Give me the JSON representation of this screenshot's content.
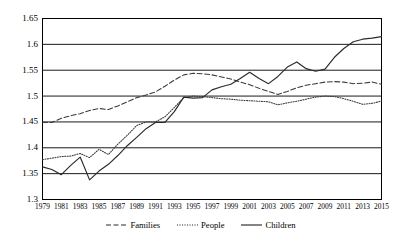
{
  "chart_data": {
    "type": "line",
    "title": "",
    "xlabel": "",
    "ylabel": "",
    "xlim": [
      1979,
      2015
    ],
    "ylim": [
      1.3,
      1.65
    ],
    "grid": "horizontal",
    "legend_position": "bottom",
    "y_ticks": [
      "1.3",
      "1.35",
      "1.4",
      "1.45",
      "1.5",
      "1.55",
      "1.6",
      "1.65"
    ],
    "y_tick_values": [
      1.3,
      1.35,
      1.4,
      1.45,
      1.5,
      1.55,
      1.6,
      1.65
    ],
    "x_tick_labels": [
      "1979",
      "1981",
      "1983",
      "1985",
      "1987",
      "1989",
      "1991",
      "1993",
      "1995",
      "1997",
      "1999",
      "2001",
      "2003",
      "2005",
      "2007",
      "2009",
      "2011",
      "2013",
      "2015"
    ],
    "x": [
      1979,
      1980,
      1981,
      1982,
      1983,
      1984,
      1985,
      1986,
      1987,
      1988,
      1989,
      1990,
      1991,
      1992,
      1993,
      1994,
      1995,
      1996,
      1997,
      1998,
      1999,
      2000,
      2001,
      2002,
      2003,
      2004,
      2005,
      2006,
      2007,
      2008,
      2009,
      2010,
      2011,
      2012,
      2013,
      2014,
      2015
    ],
    "series": [
      {
        "name": "Families",
        "style": "dashed",
        "color": "#3a3a3a",
        "values": [
          1.449,
          1.449,
          1.457,
          1.462,
          1.466,
          1.472,
          1.476,
          1.474,
          1.481,
          1.489,
          1.497,
          1.502,
          1.508,
          1.519,
          1.531,
          1.541,
          1.544,
          1.543,
          1.541,
          1.537,
          1.533,
          1.527,
          1.522,
          1.515,
          1.509,
          1.503,
          1.509,
          1.516,
          1.521,
          1.524,
          1.527,
          1.528,
          1.527,
          1.524,
          1.525,
          1.527,
          1.523
        ]
      },
      {
        "name": "People",
        "style": "dotted",
        "color": "#3a3a3a",
        "values": [
          1.377,
          1.38,
          1.383,
          1.384,
          1.389,
          1.381,
          1.397,
          1.387,
          1.407,
          1.424,
          1.443,
          1.45,
          1.45,
          1.46,
          1.478,
          1.497,
          1.5,
          1.499,
          1.497,
          1.495,
          1.494,
          1.492,
          1.491,
          1.49,
          1.489,
          1.483,
          1.487,
          1.49,
          1.494,
          1.498,
          1.5,
          1.499,
          1.495,
          1.49,
          1.484,
          1.486,
          1.49
        ]
      },
      {
        "name": "Children",
        "style": "solid",
        "color": "#2a2a2a",
        "values": [
          1.363,
          1.358,
          1.348,
          1.366,
          1.382,
          1.338,
          1.355,
          1.368,
          1.385,
          1.404,
          1.42,
          1.437,
          1.449,
          1.449,
          1.47,
          1.498,
          1.496,
          1.497,
          1.512,
          1.518,
          1.523,
          1.534,
          1.546,
          1.534,
          1.524,
          1.538,
          1.556,
          1.566,
          1.553,
          1.548,
          1.552,
          1.575,
          1.592,
          1.605,
          1.61,
          1.612,
          1.615
        ]
      }
    ]
  },
  "series_detail": {
    "families": {
      "label": "Families",
      "points": [
        [
          1979,
          1.449
        ],
        [
          1980,
          1.449
        ],
        [
          1981,
          1.457
        ],
        [
          1982,
          1.462
        ],
        [
          1983,
          1.466
        ],
        [
          1984,
          1.472
        ],
        [
          1985,
          1.476
        ],
        [
          1986,
          1.474
        ],
        [
          1987,
          1.481
        ],
        [
          1988,
          1.489
        ],
        [
          1989,
          1.497
        ],
        [
          1990,
          1.502
        ],
        [
          1991,
          1.508
        ],
        [
          1992,
          1.519
        ],
        [
          1993,
          1.531
        ],
        [
          1994,
          1.541
        ],
        [
          1995,
          1.544
        ],
        [
          1996,
          1.543
        ],
        [
          1997,
          1.541
        ],
        [
          1998,
          1.537
        ],
        [
          1999,
          1.533
        ],
        [
          2000,
          1.527
        ],
        [
          2001,
          1.522
        ],
        [
          2002,
          1.515
        ],
        [
          2003,
          1.509
        ],
        [
          2004,
          1.503
        ],
        [
          2005,
          1.509
        ],
        [
          2006,
          1.516
        ],
        [
          2007,
          1.521
        ],
        [
          2008,
          1.524
        ],
        [
          2009,
          1.527
        ],
        [
          2010,
          1.528
        ],
        [
          2011,
          1.527
        ],
        [
          2012,
          1.524
        ],
        [
          2013,
          1.525
        ],
        [
          2014,
          1.527
        ],
        [
          2015,
          1.523
        ]
      ]
    },
    "people": {
      "label": "People",
      "points": [
        [
          1979,
          1.377
        ],
        [
          1980,
          1.38
        ],
        [
          1981,
          1.383
        ],
        [
          1982,
          1.384
        ],
        [
          1983,
          1.389
        ],
        [
          1984,
          1.381
        ],
        [
          1985,
          1.397
        ],
        [
          1986,
          1.387
        ],
        [
          1987,
          1.407
        ],
        [
          1988,
          1.424
        ],
        [
          1989,
          1.443
        ],
        [
          1990,
          1.45
        ],
        [
          1991,
          1.45
        ],
        [
          1992,
          1.46
        ],
        [
          1993,
          1.478
        ],
        [
          1994,
          1.497
        ],
        [
          1995,
          1.5
        ],
        [
          1996,
          1.499
        ],
        [
          1997,
          1.497
        ],
        [
          1998,
          1.495
        ],
        [
          1999,
          1.494
        ],
        [
          2000,
          1.492
        ],
        [
          2001,
          1.491
        ],
        [
          2002,
          1.49
        ],
        [
          2003,
          1.489
        ],
        [
          2004,
          1.483
        ],
        [
          2005,
          1.487
        ],
        [
          2006,
          1.49
        ],
        [
          2007,
          1.494
        ],
        [
          2008,
          1.498
        ],
        [
          2009,
          1.5
        ],
        [
          2010,
          1.499
        ],
        [
          2011,
          1.495
        ],
        [
          2012,
          1.49
        ],
        [
          2013,
          1.484
        ],
        [
          2014,
          1.486
        ],
        [
          2015,
          1.49
        ]
      ]
    },
    "children": {
      "label": "Children",
      "points": [
        [
          1979,
          1.363
        ],
        [
          1980,
          1.358
        ],
        [
          1981,
          1.348
        ],
        [
          1982,
          1.366
        ],
        [
          1983,
          1.382
        ],
        [
          1984,
          1.338
        ],
        [
          1985,
          1.355
        ],
        [
          1986,
          1.368
        ],
        [
          1987,
          1.385
        ],
        [
          1988,
          1.404
        ],
        [
          1989,
          1.42
        ],
        [
          1990,
          1.437
        ],
        [
          1991,
          1.449
        ],
        [
          1992,
          1.449
        ],
        [
          1993,
          1.47
        ],
        [
          1994,
          1.498
        ],
        [
          1995,
          1.496
        ],
        [
          1996,
          1.497
        ],
        [
          1997,
          1.512
        ],
        [
          1998,
          1.518
        ],
        [
          1999,
          1.523
        ],
        [
          2000,
          1.534
        ],
        [
          2001,
          1.546
        ],
        [
          2002,
          1.534
        ],
        [
          2003,
          1.524
        ],
        [
          2004,
          1.538
        ],
        [
          2005,
          1.556
        ],
        [
          2006,
          1.566
        ],
        [
          2007,
          1.553
        ],
        [
          2008,
          1.548
        ],
        [
          2009,
          1.552
        ],
        [
          2010,
          1.575
        ],
        [
          2011,
          1.592
        ],
        [
          2012,
          1.605
        ],
        [
          2013,
          1.61
        ],
        [
          2014,
          1.612
        ],
        [
          2015,
          1.615
        ]
      ]
    }
  },
  "legend": {
    "items": [
      {
        "label": "Families",
        "style": "dashed"
      },
      {
        "label": "People",
        "style": "dotted"
      },
      {
        "label": "Children",
        "style": "solid"
      }
    ]
  },
  "colors": {
    "line": "#2a2a2a",
    "grid": "#000000",
    "axis": "#000000",
    "text": "#000000",
    "background": "#ffffff"
  }
}
